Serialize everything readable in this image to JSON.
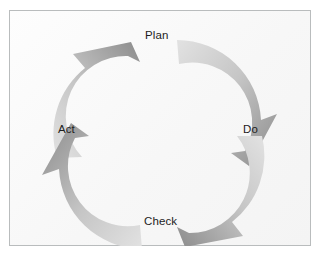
{
  "diagram": {
    "type": "cyclic-process-diagram",
    "background_color": "#ffffff",
    "panel_color": "#fbfbfb",
    "border_color": "#b9bcbd",
    "label_color": "#1d1d1d",
    "arrow_light_color": "#dcdcdc",
    "arrow_dark_color": "#8a8a8a",
    "direction": "clockwise",
    "nodes": [
      {
        "id": "plan",
        "label": "Plan",
        "position": "top"
      },
      {
        "id": "do",
        "label": "Do",
        "position": "right"
      },
      {
        "id": "check",
        "label": "Check",
        "position": "bottom"
      },
      {
        "id": "act",
        "label": "Act",
        "position": "left"
      }
    ],
    "arrows": [
      {
        "id": "arrow-act-to-plan",
        "from": "Act",
        "to": "Plan",
        "quadrant": "top-left"
      },
      {
        "id": "arrow-plan-to-do",
        "from": "Plan",
        "to": "Do",
        "quadrant": "top-right"
      },
      {
        "id": "arrow-do-to-check",
        "from": "Do",
        "to": "Check",
        "quadrant": "bottom-right"
      },
      {
        "id": "arrow-check-to-act",
        "from": "Check",
        "to": "Act",
        "quadrant": "bottom-left"
      }
    ]
  }
}
